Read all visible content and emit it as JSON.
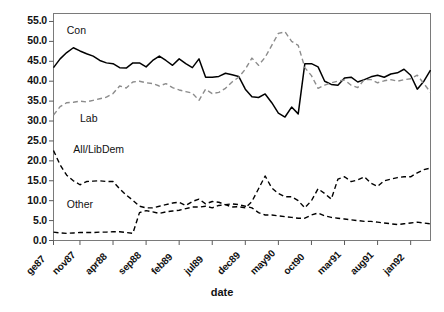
{
  "chart_data": {
    "type": "line",
    "title": "",
    "subtitle": "",
    "xlabel": "date",
    "ylabel": "",
    "ylim": [
      0.0,
      57.0
    ],
    "yticks": [
      0.0,
      5.0,
      10.0,
      15.0,
      20.0,
      25.0,
      30.0,
      35.0,
      40.0,
      45.0,
      50.0,
      55.0
    ],
    "ytick_labels": [
      "0.0",
      "5.0",
      "10.0",
      "15.0",
      "20.0",
      "25.0",
      "30.0",
      "35.0",
      "40.0",
      "45.0",
      "50.0",
      "55.0"
    ],
    "grid": false,
    "legend": "inline-labels",
    "xtick_labels": [
      "ge87",
      "nov87",
      "apr88",
      "sep88",
      "feb89",
      "jul89",
      "dec89",
      "may90",
      "oct90",
      "mar91",
      "aug91",
      "jan92"
    ],
    "x_index_of_ticks": [
      0,
      4,
      9,
      14,
      19,
      24,
      29,
      34,
      39,
      44,
      49,
      54
    ],
    "n_points": 58,
    "annotations": [
      {
        "text": "Con",
        "x_index": 2,
        "y": 52.5
      },
      {
        "text": "Lab",
        "x_index": 4,
        "y": 30.5
      },
      {
        "text": "All/LibDem",
        "x_index": 3,
        "y": 22.8
      },
      {
        "text": "Other",
        "x_index": 2,
        "y": 9.0
      }
    ],
    "series": [
      {
        "name": "Con",
        "style": "solid",
        "color": "#000000",
        "values": [
          43.4,
          45.6,
          47.2,
          48.4,
          47.6,
          46.9,
          46.3,
          45.2,
          44.6,
          44.4,
          43.4,
          43.3,
          44.6,
          44.6,
          43.6,
          45.2,
          46.3,
          45.2,
          44.0,
          45.6,
          44.4,
          43.4,
          45.6,
          41.0,
          41.0,
          41.2,
          42.0,
          41.6,
          41.2,
          38.0,
          36.1,
          35.9,
          36.8,
          34.6,
          32.0,
          31.0,
          33.5,
          31.8,
          44.4,
          44.4,
          43.6,
          40.0,
          39.2,
          39.0,
          40.8,
          41.0,
          39.8,
          40.4,
          41.1,
          41.5,
          41.0,
          41.8,
          42.1,
          43.0,
          41.5,
          38.0,
          40.0,
          42.8
        ]
      },
      {
        "name": "Lab",
        "style": "dashed",
        "color": "#8c8c8c",
        "values": [
          31.5,
          33.6,
          34.6,
          34.7,
          35.0,
          34.8,
          35.2,
          35.6,
          36.0,
          36.9,
          38.8,
          38.3,
          39.8,
          40.0,
          39.6,
          39.4,
          38.8,
          39.4,
          38.4,
          37.8,
          37.4,
          37.0,
          35.2,
          38.0,
          36.9,
          37.2,
          38.2,
          39.8,
          41.0,
          43.0,
          45.8,
          44.0,
          46.0,
          49.0,
          52.0,
          52.4,
          50.0,
          49.0,
          43.4,
          41.4,
          38.2,
          39.0,
          39.6,
          40.0,
          40.3,
          39.0,
          38.4,
          40.4,
          40.4,
          39.6,
          40.1,
          40.4,
          40.0,
          40.4,
          40.6,
          41.5,
          39.4,
          37.2
        ]
      },
      {
        "name": "All/LibDem",
        "style": "dashed",
        "color": "#000000",
        "values": [
          22.6,
          19.0,
          16.4,
          15.0,
          14.0,
          14.8,
          14.9,
          15.0,
          14.8,
          14.8,
          13.0,
          11.4,
          10.1,
          8.6,
          8.2,
          8.2,
          8.6,
          9.0,
          9.4,
          9.6,
          8.8,
          9.8,
          10.4,
          9.2,
          9.8,
          9.6,
          9.0,
          8.4,
          8.5,
          8.2,
          9.8,
          13.0,
          16.2,
          13.2,
          11.8,
          11.0,
          11.0,
          10.0,
          8.2,
          10.0,
          13.0,
          11.8,
          10.4,
          15.4,
          16.0,
          14.8,
          15.2,
          16.0,
          14.4,
          13.6,
          15.0,
          15.4,
          15.8,
          16.0,
          16.0,
          17.0,
          17.8,
          18.2
        ]
      },
      {
        "name": "Other",
        "style": "dashed",
        "color": "#000000",
        "values": [
          2.1,
          1.9,
          1.8,
          1.9,
          2.0,
          2.0,
          2.0,
          2.1,
          2.1,
          2.2,
          2.2,
          2.0,
          1.8,
          7.0,
          7.5,
          7.2,
          6.8,
          7.2,
          7.4,
          7.6,
          8.0,
          8.4,
          8.4,
          8.6,
          8.2,
          8.8,
          9.0,
          9.2,
          9.0,
          8.6,
          8.2,
          7.0,
          6.4,
          6.4,
          6.2,
          6.0,
          5.8,
          5.6,
          5.6,
          6.4,
          6.9,
          6.2,
          5.8,
          5.6,
          5.4,
          5.2,
          5.0,
          4.8,
          4.8,
          4.6,
          4.4,
          4.2,
          4.0,
          4.2,
          4.4,
          4.6,
          4.4,
          4.2
        ]
      }
    ]
  },
  "figure": {
    "xaxis_title": "date",
    "caption_fragment": ""
  }
}
